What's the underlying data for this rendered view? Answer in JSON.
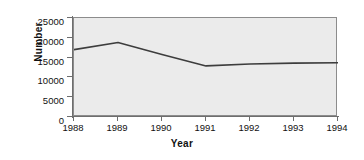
{
  "chart_data": {
    "type": "line",
    "title": "",
    "xlabel": "Year",
    "ylabel": "Number",
    "categories": [
      "1988",
      "1989",
      "1990",
      "1991",
      "1992",
      "1993",
      "1994"
    ],
    "x": [
      1988,
      1989,
      1990,
      1991,
      1992,
      1993,
      1994
    ],
    "values": [
      17000,
      18800,
      15800,
      12900,
      13400,
      13600,
      13700
    ],
    "series": [
      {
        "name": "Number",
        "values": [
          17000,
          18800,
          15800,
          12900,
          13400,
          13600,
          13700
        ],
        "color": "#3d3d3d"
      }
    ],
    "ylim": [
      0,
      25000
    ],
    "yticks": [
      0,
      5000,
      10000,
      15000,
      20000,
      25000
    ],
    "ytick_labels": [
      "0",
      "5000",
      "10000",
      "15000",
      "20000",
      "25000"
    ],
    "xlim": [
      1988,
      1994
    ],
    "grid": false,
    "legend": false,
    "legend_position": "none",
    "plot_background": "#ebebeb",
    "axis_color": "#6e6e6e",
    "line_color": "#3d3d3d"
  }
}
